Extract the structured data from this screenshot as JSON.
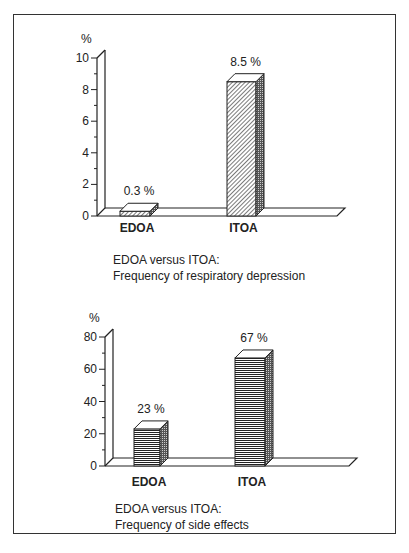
{
  "chart_data": [
    {
      "type": "bar",
      "title": "EDOA versus ITOA: Frequency of respiratory depression",
      "caption_line1": "EDOA versus ITOA:",
      "caption_line2": "Frequency of respiratory depression",
      "xlabel": "",
      "ylabel": "%",
      "categories": [
        "EDOA",
        "ITOA"
      ],
      "values": [
        0.3,
        8.5
      ],
      "data_labels": [
        "0.3 %",
        "8.5 %"
      ],
      "ylim": [
        0,
        10
      ],
      "yticks": [
        0,
        2,
        4,
        6,
        8,
        10
      ],
      "style": "3d bars, diagonal hatch fill",
      "grid": false,
      "legend": null
    },
    {
      "type": "bar",
      "title": "EDOA versus ITOA: Frequency of side effects",
      "caption_line1": "EDOA versus ITOA:",
      "caption_line2": "Frequency of side effects",
      "xlabel": "",
      "ylabel": "%",
      "categories": [
        "EDOA",
        "ITOA"
      ],
      "values": [
        23,
        67
      ],
      "data_labels": [
        "23 %",
        "67 %"
      ],
      "ylim": [
        0,
        80
      ],
      "yticks": [
        0,
        20,
        40,
        60,
        80
      ],
      "style": "3d bars, horizontal line fill",
      "grid": false,
      "legend": null
    }
  ]
}
